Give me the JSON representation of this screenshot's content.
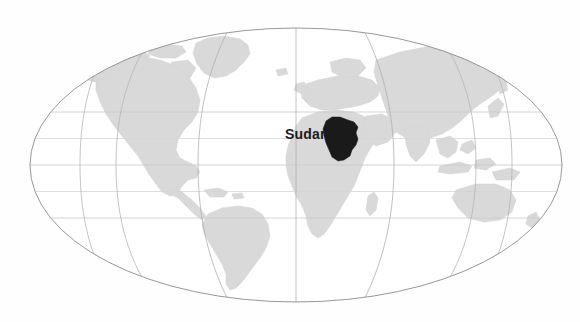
{
  "figure": {
    "name": "world-locator-map",
    "projection": "Mollweide",
    "background_color": "#fefefe",
    "width": 580,
    "height": 322
  },
  "map": {
    "ellipse": {
      "center_x": 296,
      "center_y": 165,
      "radius_x": 266,
      "radius_y": 137,
      "outline_color": "#8c8c8c",
      "outline_width": 0.9,
      "fill_color": "#ffffff"
    },
    "land": {
      "fill_color": "#d9d9d9",
      "stroke_color": "#cfcfcf"
    },
    "graticule": {
      "color": "#c8c8c8",
      "width": 0.8,
      "parallels_labels": [
        "60N",
        "30N",
        "0",
        "30S",
        "60S"
      ],
      "parallels_y": [
        112,
        138.5,
        165,
        191.5,
        218
      ],
      "meridians_labels": [
        "120W",
        "60W",
        "0",
        "60E",
        "120E"
      ],
      "meridian_interval_degrees": 60,
      "central_meridian": 0
    },
    "highlight": {
      "country": "Sudan",
      "fill_color": "#1a1a1a",
      "centroid_x": 340,
      "centroid_y": 140
    },
    "labels": [
      {
        "id": "sudan-label",
        "text": "Sudan",
        "x": 285,
        "y": 127,
        "color": "#1b1b1b",
        "font_size_px": 14,
        "bold": true
      }
    ],
    "continents": [
      "North America",
      "South America",
      "Europe",
      "Africa",
      "Asia",
      "Australia",
      "Antarctica",
      "Greenland"
    ]
  }
}
